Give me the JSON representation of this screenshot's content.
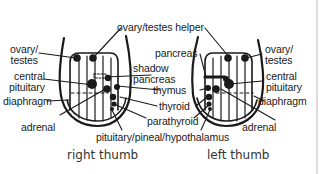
{
  "diagram": {
    "colors": {
      "ink": "#1a1a1a",
      "background": "#ffffff",
      "edge": "#dcdcdc"
    },
    "thumbs": [
      {
        "id": "right",
        "caption": "right thumb",
        "labels": {
          "ovary_testes": "ovary/\ntestes",
          "ovary_testes_line1": "ovary/",
          "ovary_testes_line2": "testes",
          "central_pituitary_line1": "central",
          "central_pituitary_line2": "pituitary",
          "diaphragm": "diaphragm",
          "adrenal": "adrenal"
        }
      },
      {
        "id": "left",
        "caption": "left thumb",
        "labels": {
          "ovary_testes_line1": "ovary/",
          "ovary_testes_line2": "testes",
          "central_pituitary_line1": "central",
          "central_pituitary_line2": "pituitary",
          "diaphragm": "diaphragm",
          "adrenal": "adrenal",
          "pancreas": "pancreas"
        }
      }
    ],
    "shared_labels": {
      "ovary_testes_helper": "ovary/testes helper",
      "shadow_pancreas_line1": "shadow",
      "shadow_pancreas_line2": "pancreas",
      "thymus": "thymus",
      "thyroid": "thyroid",
      "parathyroid": "parathyroid",
      "pituitary_pineal_hypothalamus": "pituitary/pineal/hypothalamus"
    }
  }
}
